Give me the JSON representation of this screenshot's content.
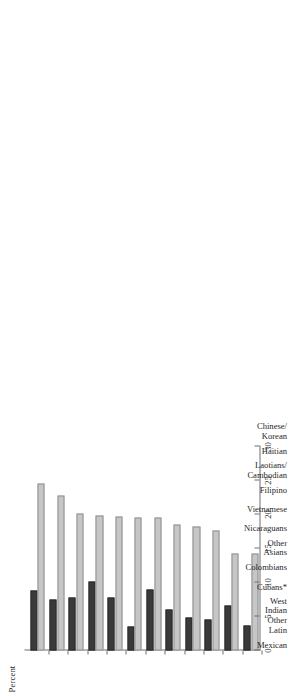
{
  "chart_data": {
    "type": "bar",
    "orientation": "horizontal",
    "title": "",
    "subtitle": "",
    "xlabel": "Percent",
    "ylabel": "",
    "value_axis_label": "Percent",
    "ylim": [
      0,
      30
    ],
    "value_ticks": [
      0,
      5,
      10,
      15,
      20,
      25,
      30
    ],
    "tick_labels": [
      "0",
      "5",
      "10",
      "15",
      "20",
      "25",
      "30"
    ],
    "grid": false,
    "legend_position": "none",
    "legend_entries": [
      "Series 1 (light gray)",
      "Series 2 (dark gray)"
    ],
    "annotations": [
      "* asterisk on Cubans indicates a footnote"
    ],
    "categories": [
      "Mexican",
      "Other Latin",
      "West Indian",
      "Cubans*",
      "Colombians",
      "Other Asians",
      "Nicaraguans",
      "Vietnamese",
      "Filipino",
      "Laotians/ Cambodian",
      "Haitian",
      "Chinese/ Korean"
    ],
    "category_lines": [
      [
        "Mexican"
      ],
      [
        "Other",
        "Latin"
      ],
      [
        "West",
        "Indian"
      ],
      [
        "Cubans*"
      ],
      [
        "Colombians"
      ],
      [
        "Other",
        "Asians"
      ],
      [
        "Nicaraguans"
      ],
      [
        "Vietnamese"
      ],
      [
        "Filipino"
      ],
      [
        "Laotians/",
        "Cambodian"
      ],
      [
        "Haitian"
      ],
      [
        "Chinese/",
        "Korean"
      ]
    ],
    "series": [
      {
        "name": "light",
        "color": "#c6c6c6",
        "values": [
          24.5,
          22.8,
          20.1,
          19.8,
          19.7,
          19.5,
          19.5,
          18.6,
          18.2,
          17.7,
          14.3,
          14.3
        ]
      },
      {
        "name": "dark",
        "color": "#3a3a3a",
        "values": [
          8.8,
          7.5,
          7.8,
          10.2,
          7.8,
          3.5,
          8.9,
          6.1,
          4.8,
          4.6,
          6.6,
          3.7
        ]
      }
    ]
  },
  "axis": {
    "value_axis_title": "Percent"
  }
}
